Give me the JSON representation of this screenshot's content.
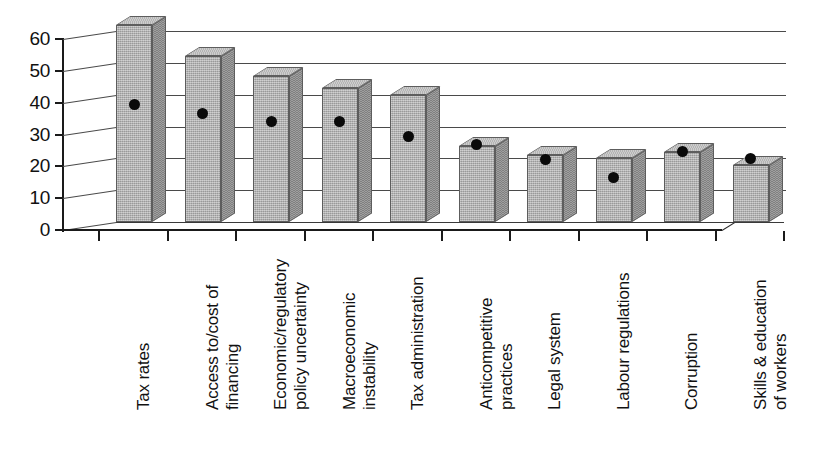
{
  "chart_data": {
    "type": "bar",
    "title": "",
    "subtitle": "",
    "xlabel": "",
    "ylabel": "",
    "ylim": [
      0,
      60
    ],
    "yticks": [
      0,
      10,
      20,
      30,
      40,
      50,
      60
    ],
    "grid": true,
    "legend_position": "none",
    "style": "3d-bar-with-point-markers",
    "categories": [
      "Tax rates",
      "Access to/cost of financing",
      "Economic/regulatory policy uncertainty",
      "Macroeconomic instability",
      "Tax administration",
      "Anticompetitive practices",
      "Legal system",
      "Labour regulations",
      "Corruption",
      "Skills & education of workers"
    ],
    "category_lines": [
      [
        "Tax rates"
      ],
      [
        "Access to/cost of",
        "financing"
      ],
      [
        "Economic/regulatory",
        "policy uncertainty"
      ],
      [
        "Macroeconomic",
        "instability"
      ],
      [
        "Tax administration"
      ],
      [
        "Anticompetitive",
        "practices"
      ],
      [
        "Legal system"
      ],
      [
        "Labour regulations"
      ],
      [
        "Corruption"
      ],
      [
        "Skills & education",
        "of workers"
      ]
    ],
    "series": [
      {
        "name": "bars",
        "type": "bar",
        "values": [
          62,
          52,
          46,
          42,
          40,
          24,
          21,
          20,
          22,
          18
        ]
      },
      {
        "name": "markers",
        "type": "scatter",
        "values": [
          37,
          34,
          31.5,
          31.5,
          27,
          24.5,
          19.5,
          14,
          22,
          20
        ]
      }
    ]
  },
  "colors": {
    "bar_face": "#a8a8a8",
    "bar_side": "#8a8a8a",
    "bar_top": "#bdbdbd",
    "bar_outline": "#5d5d5d",
    "marker": "#0a0a0a",
    "axis": "#1a1a1a",
    "gridline": "#4a4a4a",
    "background": "#ffffff"
  }
}
